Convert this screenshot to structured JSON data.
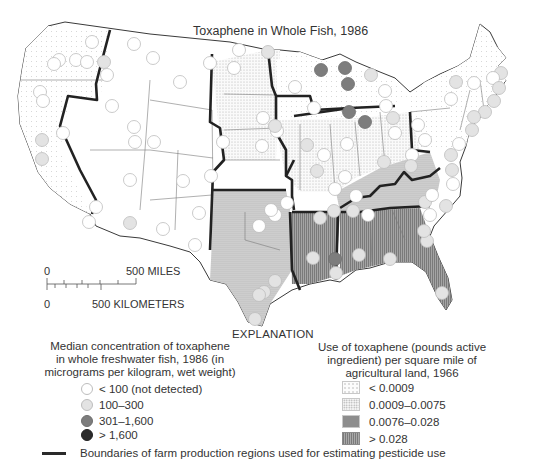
{
  "title": "Toxaphene in Whole Fish, 1986",
  "scale_bar": {
    "miles_zero": "0",
    "miles_label": "500 MILES",
    "km_zero": "0",
    "km_label": "500 KILOMETERS"
  },
  "explanation_heading": "EXPLANATION",
  "concentration_legend": {
    "heading_lines": [
      "Median concentration of toxaphene",
      "in whole freshwater fish, 1986 (in",
      "micrograms per kilogram, wet weight)"
    ],
    "classes": [
      {
        "label": "< 100 (not detected)",
        "fill": "#ffffff",
        "stroke": "#bdbdbd"
      },
      {
        "label": "100–300",
        "fill": "#e3e3e3",
        "stroke": "#bdbdbd"
      },
      {
        "label": "301–1,600",
        "fill": "#7d7d7d",
        "stroke": "#6e6e6e"
      },
      {
        "label": "> 1,600",
        "fill": "#2b2b2b",
        "stroke": "#222222"
      }
    ]
  },
  "use_legend": {
    "heading_lines": [
      "Use of toxaphene (pounds active",
      "ingredient) per square mile of",
      "agricultural land, 1966"
    ],
    "classes": [
      {
        "label": "< 0.0009"
      },
      {
        "label": "0.0009–0.0075"
      },
      {
        "label": "0.0076–0.028"
      },
      {
        "label": "> 0.028"
      }
    ]
  },
  "boundary_legend": {
    "label": "Boundaries of farm production regions used for estimating pesticide use",
    "color": "#2a2a2a"
  },
  "map": {
    "sites": [
      {
        "x": 92,
        "y": 42,
        "c": 0
      },
      {
        "x": 59,
        "y": 60,
        "c": 0
      },
      {
        "x": 76,
        "y": 60,
        "c": 0
      },
      {
        "x": 54,
        "y": 64,
        "c": 0
      },
      {
        "x": 87,
        "y": 62,
        "c": 0
      },
      {
        "x": 104,
        "y": 62,
        "c": 1
      },
      {
        "x": 107,
        "y": 75,
        "c": 0
      },
      {
        "x": 40,
        "y": 92,
        "c": 0
      },
      {
        "x": 43,
        "y": 101,
        "c": 0
      },
      {
        "x": 112,
        "y": 106,
        "c": 0
      },
      {
        "x": 134,
        "y": 44,
        "c": 0
      },
      {
        "x": 153,
        "y": 58,
        "c": 0
      },
      {
        "x": 180,
        "y": 82,
        "c": 0
      },
      {
        "x": 210,
        "y": 63,
        "c": 0
      },
      {
        "x": 239,
        "y": 50,
        "c": 0
      },
      {
        "x": 234,
        "y": 68,
        "c": 0
      },
      {
        "x": 134,
        "y": 127,
        "c": 0
      },
      {
        "x": 135,
        "y": 142,
        "c": 0
      },
      {
        "x": 154,
        "y": 142,
        "c": 0
      },
      {
        "x": 63,
        "y": 133,
        "c": 0
      },
      {
        "x": 42,
        "y": 140,
        "c": 1
      },
      {
        "x": 42,
        "y": 159,
        "c": 1
      },
      {
        "x": 130,
        "y": 180,
        "c": 0
      },
      {
        "x": 183,
        "y": 181,
        "c": 0
      },
      {
        "x": 211,
        "y": 176,
        "c": 0
      },
      {
        "x": 223,
        "y": 142,
        "c": 0
      },
      {
        "x": 263,
        "y": 118,
        "c": 0
      },
      {
        "x": 268,
        "y": 52,
        "c": 1
      },
      {
        "x": 96,
        "y": 207,
        "c": 0
      },
      {
        "x": 89,
        "y": 222,
        "c": 0
      },
      {
        "x": 130,
        "y": 223,
        "c": 1
      },
      {
        "x": 163,
        "y": 229,
        "c": 0
      },
      {
        "x": 195,
        "y": 245,
        "c": 0
      },
      {
        "x": 321,
        "y": 70,
        "c": 2
      },
      {
        "x": 345,
        "y": 68,
        "c": 2
      },
      {
        "x": 371,
        "y": 75,
        "c": 1
      },
      {
        "x": 295,
        "y": 87,
        "c": 0
      },
      {
        "x": 314,
        "y": 108,
        "c": 0
      },
      {
        "x": 348,
        "y": 84,
        "c": 2
      },
      {
        "x": 385,
        "y": 91,
        "c": 0
      },
      {
        "x": 349,
        "y": 112,
        "c": 2
      },
      {
        "x": 365,
        "y": 122,
        "c": 2
      },
      {
        "x": 386,
        "y": 106,
        "c": 0
      },
      {
        "x": 393,
        "y": 118,
        "c": 1
      },
      {
        "x": 277,
        "y": 131,
        "c": 0
      },
      {
        "x": 275,
        "y": 126,
        "c": 1
      },
      {
        "x": 307,
        "y": 145,
        "c": 1
      },
      {
        "x": 324,
        "y": 155,
        "c": 0
      },
      {
        "x": 395,
        "y": 133,
        "c": 0
      },
      {
        "x": 418,
        "y": 125,
        "c": 0
      },
      {
        "x": 425,
        "y": 140,
        "c": 0
      },
      {
        "x": 262,
        "y": 146,
        "c": 0
      },
      {
        "x": 317,
        "y": 171,
        "c": 1
      },
      {
        "x": 345,
        "y": 177,
        "c": 0
      },
      {
        "x": 384,
        "y": 162,
        "c": 1
      },
      {
        "x": 412,
        "y": 155,
        "c": 0
      },
      {
        "x": 411,
        "y": 166,
        "c": 1
      },
      {
        "x": 347,
        "y": 144,
        "c": 0
      },
      {
        "x": 335,
        "y": 189,
        "c": 0
      },
      {
        "x": 356,
        "y": 196,
        "c": 0
      },
      {
        "x": 368,
        "y": 215,
        "c": 0
      },
      {
        "x": 353,
        "y": 211,
        "c": 1
      },
      {
        "x": 334,
        "y": 211,
        "c": 1
      },
      {
        "x": 287,
        "y": 203,
        "c": 0
      },
      {
        "x": 275,
        "y": 215,
        "c": 0
      },
      {
        "x": 425,
        "y": 202,
        "c": 1
      },
      {
        "x": 430,
        "y": 215,
        "c": 0
      },
      {
        "x": 456,
        "y": 82,
        "c": 1
      },
      {
        "x": 474,
        "y": 83,
        "c": 0
      },
      {
        "x": 451,
        "y": 99,
        "c": 0
      },
      {
        "x": 501,
        "y": 73,
        "c": 1
      },
      {
        "x": 493,
        "y": 78,
        "c": 0
      },
      {
        "x": 499,
        "y": 88,
        "c": 1
      },
      {
        "x": 494,
        "y": 101,
        "c": 1
      },
      {
        "x": 485,
        "y": 112,
        "c": 1
      },
      {
        "x": 474,
        "y": 117,
        "c": 1
      },
      {
        "x": 472,
        "y": 130,
        "c": 1
      },
      {
        "x": 459,
        "y": 144,
        "c": 0
      },
      {
        "x": 451,
        "y": 155,
        "c": 1
      },
      {
        "x": 452,
        "y": 170,
        "c": 1
      },
      {
        "x": 453,
        "y": 184,
        "c": 0
      },
      {
        "x": 446,
        "y": 206,
        "c": 1
      },
      {
        "x": 432,
        "y": 195,
        "c": 0
      },
      {
        "x": 320,
        "y": 218,
        "c": 1
      },
      {
        "x": 335,
        "y": 259,
        "c": 2
      },
      {
        "x": 313,
        "y": 258,
        "c": 1
      },
      {
        "x": 336,
        "y": 273,
        "c": 1
      },
      {
        "x": 359,
        "y": 255,
        "c": 1
      },
      {
        "x": 390,
        "y": 259,
        "c": 1
      },
      {
        "x": 427,
        "y": 241,
        "c": 1
      },
      {
        "x": 424,
        "y": 231,
        "c": 1
      },
      {
        "x": 442,
        "y": 293,
        "c": 1
      },
      {
        "x": 264,
        "y": 292,
        "c": 1
      },
      {
        "x": 259,
        "y": 295,
        "c": 1
      },
      {
        "x": 255,
        "y": 319,
        "c": 1
      },
      {
        "x": 275,
        "y": 281,
        "c": 1
      },
      {
        "x": 271,
        "y": 210,
        "c": 0
      },
      {
        "x": 259,
        "y": 226,
        "c": 0
      },
      {
        "x": 199,
        "y": 213,
        "c": 0
      }
    ]
  }
}
